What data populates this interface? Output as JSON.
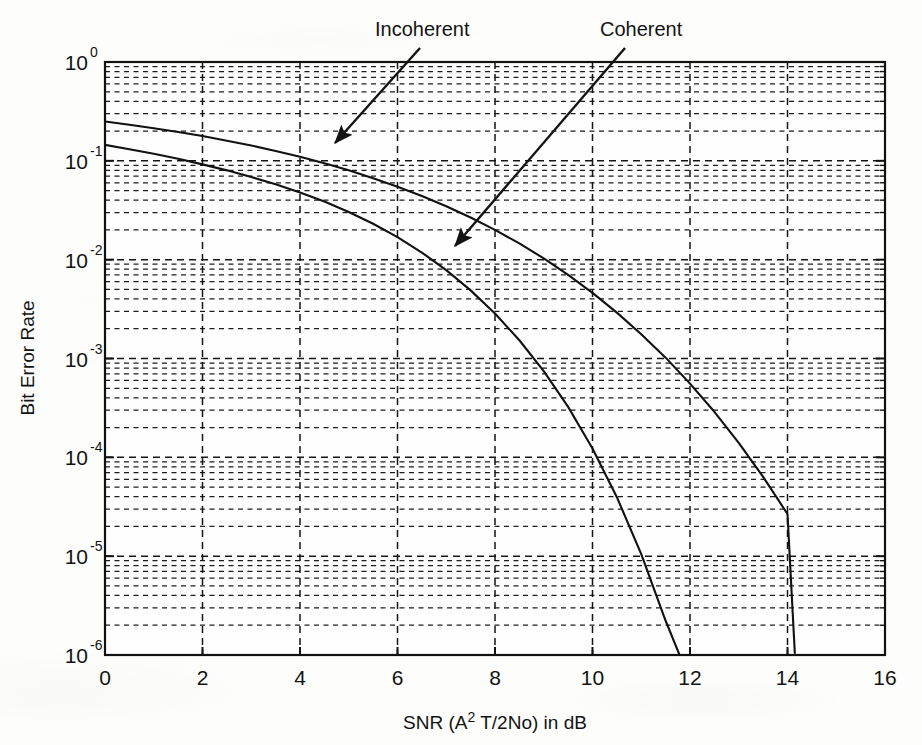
{
  "chart_data": {
    "type": "line",
    "title": "",
    "xlabel": "SNR (A2 T/2No) in dB",
    "xlabel_parts": {
      "pre": "SNR (A",
      "sup": "2",
      "post": " T/2No) in dB"
    },
    "ylabel": "Bit Error Rate",
    "xlim": [
      0,
      16
    ],
    "ylim": [
      1e-06,
      1
    ],
    "yscale": "log",
    "xscale": "linear",
    "xticks": [
      0,
      2,
      4,
      6,
      8,
      10,
      12,
      14,
      16
    ],
    "xtick_labels": [
      "0",
      "2",
      "4",
      "6",
      "8",
      "10",
      "12",
      "14",
      "16"
    ],
    "yticks": [
      1,
      0.1,
      0.01,
      0.001,
      0.0001,
      1e-05,
      1e-06
    ],
    "ytick_labels": [
      "10",
      "10",
      "10",
      "10",
      "10",
      "10",
      "10"
    ],
    "ytick_exponents": [
      "0",
      "-1",
      "-2",
      "-3",
      "-4",
      "-5",
      "-6"
    ],
    "grid": true,
    "grid_style": "dashed",
    "minor_grid": true,
    "legend_position": "annotations",
    "series": [
      {
        "name": "Incoherent",
        "x": [
          0,
          0.5,
          1,
          1.5,
          2,
          2.5,
          3,
          3.5,
          4,
          4.5,
          5,
          5.5,
          6,
          6.5,
          7,
          7.5,
          8,
          8.5,
          9,
          9.5,
          10,
          10.5,
          11,
          11.5,
          12,
          12.5,
          13,
          13.5,
          14,
          14.15
        ],
        "values": [
          0.25,
          0.232,
          0.214,
          0.196,
          0.178,
          0.16,
          0.143,
          0.126,
          0.11,
          0.0945,
          0.0801,
          0.0668,
          0.0548,
          0.0441,
          0.0347,
          0.0267,
          0.02,
          0.0146,
          0.0103,
          0.00703,
          0.00461,
          0.00291,
          0.00176,
          0.00102,
          0.000557,
          0.000289,
          0.00014,
          6.35e-05,
          2.67e-05,
          1.05e-06
        ]
      },
      {
        "name": "Coherent",
        "x": [
          0,
          0.5,
          1,
          1.5,
          2,
          2.5,
          3,
          3.5,
          4,
          4.5,
          5,
          5.5,
          6,
          6.5,
          7,
          7.5,
          8,
          8.5,
          9,
          9.5,
          10,
          10.5,
          11,
          11.5,
          12,
          12.5,
          13,
          13.5,
          13.65
        ],
        "values": [
          0.145,
          0.131,
          0.118,
          0.105,
          0.0921,
          0.0801,
          0.0686,
          0.0579,
          0.0479,
          0.0387,
          0.0304,
          0.0231,
          0.0169,
          0.0118,
          0.00784,
          0.00489,
          0.00285,
          0.00153,
          0.000746,
          0.000324,
          0.000123,
          3.95e-05,
          1.05e-05,
          2.22e-06,
          3.6e-07,
          4.4e-08,
          4e-09,
          2e-10,
          1e-09
        ]
      }
    ],
    "annotations": [
      {
        "name": "Incoherent",
        "text": "Incoherent",
        "text_x": 375,
        "text_y": 36,
        "arrow_from": [
          420,
          48
        ],
        "arrow_to": [
          335,
          143
        ]
      },
      {
        "name": "Coherent",
        "text": "Coherent",
        "text_x": 600,
        "text_y": 36,
        "arrow_from": [
          625,
          48
        ],
        "arrow_to": [
          455,
          246
        ]
      }
    ]
  },
  "colors": {
    "background": "#fdfdfc",
    "ink": "#131313",
    "curve": "#111111",
    "grid": "#1a1a1a"
  }
}
